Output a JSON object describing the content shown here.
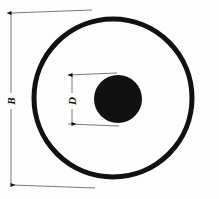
{
  "figure": {
    "type": "engineering-cross-section-diagram",
    "background_color": "#fdfdfd",
    "line_color": "#111111",
    "fill_color": "#111111",
    "dimension_line_color": "#7a7a7a"
  },
  "shapes": {
    "outer_ring": {
      "name": "outer-circle",
      "cx": 113,
      "cy": 98,
      "r": 79,
      "stroke_width": 5,
      "fill": "none",
      "stroke": "#111111"
    },
    "inner_bore": {
      "name": "inner-circle",
      "cx": 118,
      "cy": 99,
      "r": 24,
      "fill": "#111111",
      "stroke": "none"
    }
  },
  "dimensions": [
    {
      "id": "B",
      "label": "B",
      "description": "overall outer diameter",
      "orientation": "vertical",
      "line_x": 11,
      "y_top": 13,
      "y_bottom": 185,
      "label_x": 11,
      "label_y": 101,
      "extension_top": {
        "x1": 11,
        "y1": 13,
        "x2": 92,
        "y2": 10
      },
      "extension_bottom": {
        "x1": 11,
        "y1": 185,
        "x2": 95,
        "y2": 188
      }
    },
    {
      "id": "D",
      "label": "D",
      "description": "bore diameter",
      "orientation": "vertical",
      "line_x": 72,
      "y_top": 75,
      "y_bottom": 124,
      "label_x": 72,
      "label_y": 101,
      "extension_top": {
        "x1": 68,
        "y1": 75,
        "x2": 117,
        "y2": 73
      },
      "extension_bottom": {
        "x1": 68,
        "y1": 124,
        "x2": 119,
        "y2": 126
      }
    }
  ]
}
